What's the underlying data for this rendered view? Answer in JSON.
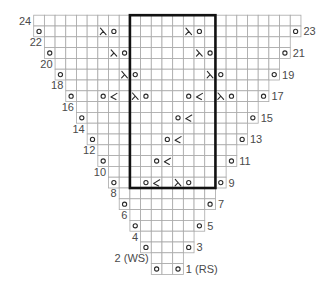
{
  "chart": {
    "total_columns": 25,
    "center_column": 12,
    "repeat_box": {
      "first_column": 9,
      "last_column": 16,
      "top_row": 24,
      "bottom_row": 9
    },
    "colors": {
      "grid": "#a9a9a9",
      "symbol": "#2b2b2b",
      "box": "#111111",
      "label": "#4a4a4a"
    },
    "legend_symbols": {
      "o": "yarn-over",
      "k2tog": "right-leaning-decrease (λ)",
      "ssk": "left-leaning-decrease"
    },
    "rows": [
      {
        "row": 24,
        "label": "24",
        "side": "left",
        "symbols": {}
      },
      {
        "row": 23,
        "label": "23",
        "side": "right",
        "symbols": {
          "0": "o",
          "6": "k2tog",
          "7": "o",
          "14": "k2tog",
          "15": "o",
          "24": "o"
        }
      },
      {
        "row": 22,
        "label": "22",
        "side": "left",
        "symbols": {}
      },
      {
        "row": 21,
        "label": "21",
        "side": "right",
        "symbols": {
          "1": "o",
          "7": "k2tog",
          "8": "o",
          "15": "k2tog",
          "16": "o",
          "23": "o"
        }
      },
      {
        "row": 20,
        "label": "20",
        "side": "left",
        "symbols": {}
      },
      {
        "row": 19,
        "label": "19",
        "side": "right",
        "symbols": {
          "2": "o",
          "8": "k2tog",
          "9": "o",
          "16": "k2tog",
          "17": "o",
          "22": "o"
        }
      },
      {
        "row": 18,
        "label": "18",
        "side": "left",
        "symbols": {}
      },
      {
        "row": 17,
        "label": "17",
        "side": "right",
        "symbols": {
          "3": "o",
          "6": "o",
          "7": "ssk",
          "9": "k2tog",
          "10": "o",
          "14": "o",
          "15": "ssk",
          "17": "k2tog",
          "18": "o",
          "21": "o"
        }
      },
      {
        "row": 16,
        "label": "16",
        "side": "left",
        "symbols": {}
      },
      {
        "row": 15,
        "label": "15",
        "side": "right",
        "symbols": {
          "4": "o",
          "13": "o",
          "14": "ssk",
          "20": "o"
        }
      },
      {
        "row": 14,
        "label": "14",
        "side": "left",
        "symbols": {}
      },
      {
        "row": 13,
        "label": "13",
        "side": "right",
        "symbols": {
          "5": "o",
          "12": "o",
          "13": "ssk",
          "19": "o"
        }
      },
      {
        "row": 12,
        "label": "12",
        "side": "left",
        "symbols": {}
      },
      {
        "row": 11,
        "label": "11",
        "side": "right",
        "symbols": {
          "6": "o",
          "11": "o",
          "12": "ssk",
          "18": "o"
        }
      },
      {
        "row": 10,
        "label": "10",
        "side": "left",
        "symbols": {}
      },
      {
        "row": 9,
        "label": "9",
        "side": "right",
        "symbols": {
          "7": "o",
          "10": "o",
          "11": "ssk",
          "13": "k2tog",
          "14": "o",
          "17": "o"
        }
      },
      {
        "row": 8,
        "label": "8",
        "side": "left",
        "symbols": {}
      },
      {
        "row": 7,
        "label": "7",
        "side": "right",
        "symbols": {
          "8": "o",
          "16": "o"
        }
      },
      {
        "row": 6,
        "label": "6",
        "side": "left",
        "symbols": {}
      },
      {
        "row": 5,
        "label": "5",
        "side": "right",
        "symbols": {
          "9": "o",
          "15": "o"
        }
      },
      {
        "row": 4,
        "label": "4",
        "side": "left",
        "symbols": {}
      },
      {
        "row": 3,
        "label": "3",
        "side": "right",
        "symbols": {
          "10": "o",
          "14": "o"
        }
      },
      {
        "row": 2,
        "label": "2 (WS)",
        "side": "left",
        "symbols": {}
      },
      {
        "row": 1,
        "label": "1 (RS)",
        "side": "right",
        "symbols": {
          "11": "o",
          "13": "o"
        }
      }
    ]
  }
}
